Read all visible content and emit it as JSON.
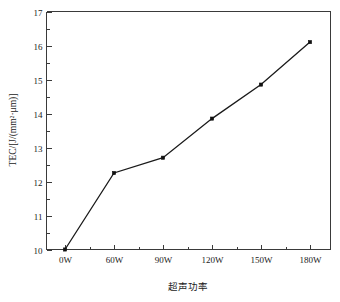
{
  "chart_data": {
    "type": "line",
    "title": "",
    "subtitle": "",
    "xlabel": "超声功率",
    "ylabel": "TEC/[J/(mm²·μm)]",
    "categories": [
      "0W",
      "60W",
      "90W",
      "120W",
      "150W",
      "180W"
    ],
    "values": [
      10.0,
      12.25,
      12.7,
      13.85,
      14.85,
      16.1
    ],
    "series": [
      {
        "name": "TEC",
        "values": [
          10.0,
          12.25,
          12.7,
          13.85,
          14.85,
          16.1
        ]
      }
    ],
    "ylim": [
      10,
      17
    ],
    "y_ticks": [
      "10",
      "11",
      "12",
      "13",
      "14",
      "15",
      "16",
      "17"
    ],
    "y_tick_values": [
      10,
      11,
      12,
      13,
      14,
      15,
      16,
      17
    ],
    "y_minor_ticks_per_interval": 1,
    "x_ticks": [
      "0W",
      "60W",
      "90W",
      "120W",
      "150W",
      "180W"
    ],
    "x_minor_ticks_per_interval": 1,
    "grid": false,
    "legend": "none",
    "marker": "square",
    "line_color": "#1a1a1a",
    "marker_color": "#111111",
    "background_color": "#ffffff",
    "axis_color": "#3a3a3a"
  }
}
